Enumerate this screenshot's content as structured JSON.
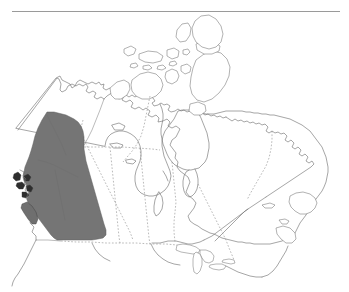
{
  "figure": {
    "kind": "distribution-map",
    "region": "Canada",
    "title": "",
    "caption": "",
    "background_color": "#ffffff",
    "rule_color": "#9a9a9a",
    "outline_color": "#6e6e6e",
    "border_color": "#8d8d8d",
    "shade_color": "#757575",
    "islet_color": "#2e2e2e"
  },
  "top_rule": {
    "present": true,
    "x": 12,
    "y": 11,
    "width": 328,
    "thickness": 1
  },
  "legend": {
    "present": false,
    "entries": [
      {
        "label": "",
        "color": "#757575"
      }
    ]
  },
  "labels": {
    "visible_text": [],
    "axis_ticks": [],
    "annotations": []
  },
  "chart_data": {
    "type": "map",
    "title": "",
    "projection": "conic",
    "highlighted_regions": [
      {
        "name": "British Columbia",
        "shaded": true,
        "fill": "#757575"
      },
      {
        "name": "Yukon (southern)",
        "shaded": true,
        "fill": "#757575"
      },
      {
        "name": "Coastal islands",
        "shaded": true,
        "fill": "#2e2e2e"
      }
    ],
    "unshaded_regions": [
      "Yukon (northern)",
      "Northwest Territories",
      "Nunavut",
      "Alberta",
      "Saskatchewan",
      "Manitoba",
      "Ontario",
      "Quebec",
      "Newfoundland and Labrador",
      "New Brunswick",
      "Nova Scotia",
      "Prince Edward Island"
    ],
    "features": {
      "province_borders": "dotted",
      "coastline": "solid thin",
      "great_lakes": true,
      "hudson_bay": true,
      "arctic_archipelago": true
    }
  }
}
